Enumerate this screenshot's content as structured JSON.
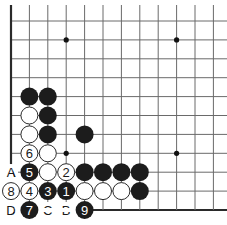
{
  "board": {
    "columns": 12,
    "rows": 11,
    "origin_x": 11,
    "origin_y": 21,
    "spacing_x": 18.4,
    "spacing_y": 18.9,
    "left_edge": true,
    "bottom_edge": true,
    "star_points": [
      [
        3,
        1
      ],
      [
        9,
        1
      ],
      [
        3,
        7
      ],
      [
        9,
        7
      ]
    ]
  },
  "stones": [
    {
      "col": 1,
      "row": 4,
      "color": "black",
      "label": ""
    },
    {
      "col": 2,
      "row": 4,
      "color": "black",
      "label": ""
    },
    {
      "col": 1,
      "row": 5,
      "color": "white",
      "label": ""
    },
    {
      "col": 2,
      "row": 5,
      "color": "black",
      "label": ""
    },
    {
      "col": 1,
      "row": 6,
      "color": "white",
      "label": ""
    },
    {
      "col": 2,
      "row": 6,
      "color": "black",
      "label": ""
    },
    {
      "col": 4,
      "row": 6,
      "color": "black",
      "label": ""
    },
    {
      "col": 1,
      "row": 7,
      "color": "white",
      "label": "6"
    },
    {
      "col": 2,
      "row": 7,
      "color": "white",
      "label": ""
    },
    {
      "col": 1,
      "row": 8,
      "color": "black",
      "label": "5"
    },
    {
      "col": 2,
      "row": 8,
      "color": "white",
      "label": ""
    },
    {
      "col": 3,
      "row": 8,
      "color": "white",
      "label": "2"
    },
    {
      "col": 4,
      "row": 8,
      "color": "black",
      "label": ""
    },
    {
      "col": 5,
      "row": 8,
      "color": "black",
      "label": ""
    },
    {
      "col": 6,
      "row": 8,
      "color": "black",
      "label": ""
    },
    {
      "col": 7,
      "row": 8,
      "color": "black",
      "label": ""
    },
    {
      "col": 0,
      "row": 9,
      "color": "white",
      "label": "8"
    },
    {
      "col": 1,
      "row": 9,
      "color": "white",
      "label": "4"
    },
    {
      "col": 2,
      "row": 9,
      "color": "black",
      "label": "3"
    },
    {
      "col": 3,
      "row": 9,
      "color": "black",
      "label": "1"
    },
    {
      "col": 4,
      "row": 9,
      "color": "white",
      "label": ""
    },
    {
      "col": 5,
      "row": 9,
      "color": "white",
      "label": ""
    },
    {
      "col": 6,
      "row": 9,
      "color": "white",
      "label": ""
    },
    {
      "col": 7,
      "row": 9,
      "color": "black",
      "label": ""
    },
    {
      "col": 1,
      "row": 10,
      "color": "black",
      "label": "7"
    },
    {
      "col": 4,
      "row": 10,
      "color": "black",
      "label": "9"
    }
  ],
  "point_labels": [
    {
      "col": 0,
      "row": 8,
      "text": "A"
    },
    {
      "col": 0,
      "row": 10,
      "text": "D"
    },
    {
      "col": 2,
      "row": 10,
      "text": "C"
    },
    {
      "col": 3,
      "row": 10,
      "text": "B"
    }
  ],
  "colors": {
    "black_stone": "#1c1c1c",
    "white_stone": "#ffffff",
    "grid_line": "#6a6a6a",
    "edge_line": "#2a2a2a"
  }
}
